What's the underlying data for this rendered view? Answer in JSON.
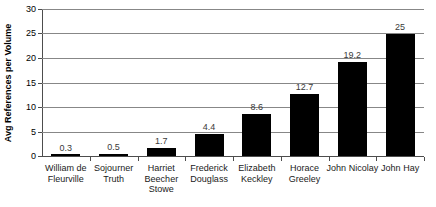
{
  "chart_data": {
    "type": "bar",
    "title": "",
    "xlabel": "",
    "ylabel": "Avg References per Volume",
    "ylim": [
      0,
      30
    ],
    "ytick_step": 5,
    "yticks": [
      "30",
      "25",
      "20",
      "15",
      "10",
      "5",
      "0"
    ],
    "grid": true,
    "legend": "none",
    "orientation": "vertical",
    "bar_color": "#000000",
    "gridline_color": "#878787",
    "axis_color": "#4d4d4d",
    "label_color": "#3a3a3a",
    "categories": [
      "William de Fleurville",
      "Sojourner Truth",
      "Harriet Beecher Stowe",
      "Frederick Douglass",
      "Elizabeth Keckley",
      "Horace Greeley",
      "John Nicolay",
      "John Hay"
    ],
    "values": [
      0.3,
      0.5,
      1.7,
      4.4,
      8.6,
      12.7,
      19.2,
      25
    ],
    "value_labels": [
      "0.3",
      "0.5",
      "1.7",
      "4.4",
      "8.6",
      "12.7",
      "19.2",
      "25"
    ]
  }
}
